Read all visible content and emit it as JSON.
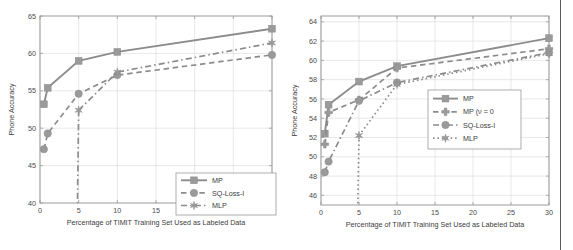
{
  "figure": {
    "background": "#ffffff",
    "line_color": "#8c8c8c",
    "marker_color": "#9a9a9a",
    "axis_color": "#9a9a9a",
    "grid_color": "#d8d8d8",
    "edge_rule_color": "#5a5a5a"
  },
  "chart_data": [
    {
      "type": "line",
      "panel": "left",
      "title": "",
      "xlabel": "Percentage of TIMIT Training Set Used as Labeled Data",
      "ylabel": "Phone Accuracy",
      "xlim": [
        0,
        30
      ],
      "ylim": [
        40,
        65
      ],
      "xticks": [
        0,
        5,
        10,
        15,
        20,
        25,
        30
      ],
      "xticklabels": [
        "0",
        "5",
        "10",
        "15",
        "20",
        "25",
        "30"
      ],
      "yticks": [
        40,
        45,
        50,
        55,
        60,
        65
      ],
      "yticklabels": [
        "40",
        "45",
        "50",
        "55",
        "60",
        "65"
      ],
      "grid": true,
      "legend_position": "lower right",
      "x": [
        0.5,
        1,
        5,
        10,
        30
      ],
      "series": [
        {
          "name": "MP",
          "marker": "square",
          "linestyle": "solid",
          "values": [
            53.2,
            55.4,
            59.0,
            60.2,
            63.3
          ]
        },
        {
          "name": "SQ-Loss-I",
          "marker": "circle",
          "linestyle": "dashed",
          "values": [
            47.2,
            49.3,
            54.6,
            57.1,
            59.8
          ]
        },
        {
          "name": "MLP",
          "marker": "star",
          "linestyle": "dashdot",
          "values": [
            null,
            null,
            52.4,
            57.5,
            61.4
          ]
        }
      ]
    },
    {
      "type": "line",
      "panel": "right",
      "title": "",
      "xlabel": "Percentage of TIMIT Training Set Used as Labeled Data",
      "ylabel": "Phone Accuracy",
      "xlim": [
        0,
        30
      ],
      "ylim": [
        45,
        64.6
      ],
      "xticks": [
        0,
        5,
        10,
        15,
        20,
        25,
        30
      ],
      "xticklabels": [
        "0",
        "5",
        "10",
        "15",
        "20",
        "25",
        "30"
      ],
      "yticks": [
        46,
        48,
        50,
        52,
        54,
        56,
        58,
        60,
        62,
        64
      ],
      "yticklabels": [
        "46",
        "48",
        "50",
        "52",
        "54",
        "56",
        "58",
        "60",
        "62",
        "64"
      ],
      "grid": true,
      "legend_position": "center right",
      "x": [
        0.5,
        1,
        5,
        10,
        30
      ],
      "series": [
        {
          "name": "MP",
          "marker": "square",
          "linestyle": "solid",
          "values": [
            52.4,
            55.4,
            57.8,
            59.4,
            62.3
          ]
        },
        {
          "name": "MP (ν = 0",
          "marker": "plus",
          "linestyle": "dashed",
          "values": [
            51.3,
            54.6,
            55.9,
            59.2,
            61.2
          ]
        },
        {
          "name": "SQ-Loss-I",
          "marker": "circle",
          "linestyle": "dashdot",
          "values": [
            48.4,
            49.5,
            55.8,
            57.7,
            60.8
          ]
        },
        {
          "name": "MLP",
          "marker": "star",
          "linestyle": "dotted",
          "values": [
            null,
            null,
            52.2,
            57.5,
            60.7
          ]
        }
      ]
    }
  ],
  "left_chart": {
    "ylabel": "Phone Accuracy",
    "xlabel": "Percentage of TIMIT Training Set Used as Labeled Data",
    "yticklabels": [
      "40",
      "45",
      "50",
      "55",
      "60",
      "65"
    ],
    "xticklabels": [
      "0",
      "5",
      "10",
      "15",
      "20",
      "25",
      "30"
    ],
    "legend": [
      {
        "label": "MP",
        "marker": "square",
        "linestyle": "solid"
      },
      {
        "label": "SQ-Loss-I",
        "marker": "circle",
        "linestyle": "dashed"
      },
      {
        "label": "MLP",
        "marker": "star",
        "linestyle": "dashdot"
      }
    ]
  },
  "right_chart": {
    "ylabel": "Phone Accuracy",
    "xlabel": "Percentage of TIMIT Training Set Used as Labeled Data",
    "yticklabels": [
      "46",
      "48",
      "50",
      "52",
      "54",
      "56",
      "58",
      "60",
      "62",
      "64"
    ],
    "xticklabels": [
      "0",
      "5",
      "10",
      "15",
      "20",
      "25",
      "30"
    ],
    "legend": [
      {
        "label": "MP",
        "marker": "square",
        "linestyle": "solid"
      },
      {
        "label": "MP (ν = 0",
        "marker": "plus",
        "linestyle": "dashed"
      },
      {
        "label": "SQ-Loss-I",
        "marker": "circle",
        "linestyle": "dashdot"
      },
      {
        "label": "MLP",
        "marker": "star",
        "linestyle": "dotted"
      }
    ]
  }
}
